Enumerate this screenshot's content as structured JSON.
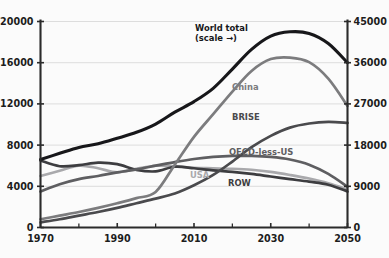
{
  "chart_data": {
    "type": "line",
    "title": "",
    "xlabel": "",
    "ylabel": "",
    "background": "#fbfbfb",
    "grid": true,
    "legend_position": "inline-annotations",
    "x": [
      1970,
      1975,
      1980,
      1985,
      1990,
      1995,
      2000,
      2005,
      2010,
      2015,
      2020,
      2025,
      2030,
      2035,
      2040,
      2045,
      2050
    ],
    "xlim": [
      1970,
      2050
    ],
    "x_ticks_major": [
      1970,
      1990,
      2010,
      2030,
      2050
    ],
    "x_ticks_minor": [
      1980,
      2000,
      2020,
      2040
    ],
    "axes": [
      {
        "id": "left",
        "ylim": [
          0,
          20000
        ],
        "ticks": [
          0,
          4000,
          8000,
          12000,
          16000,
          20000
        ],
        "tick_labels": [
          "0",
          "4000",
          "8000",
          "12000",
          "16000",
          "20000"
        ]
      },
      {
        "id": "right",
        "ylim": [
          0,
          45000
        ],
        "ticks": [
          0,
          9000,
          18000,
          27000,
          36000,
          45000
        ],
        "tick_labels": [
          "0",
          "9000",
          "18000",
          "27000",
          "36000",
          "45000"
        ]
      }
    ],
    "series": [
      {
        "name": "World total",
        "label": "World total",
        "sublabel": "(scale →)",
        "axis": "right",
        "color": "#17171a",
        "width": 3.1,
        "label_x": 195,
        "label_y": 31,
        "sublabel_x": 195,
        "sublabel_y": 41,
        "values": [
          14850,
          16200,
          17500,
          18300,
          19500,
          20800,
          22600,
          25200,
          27500,
          30400,
          34600,
          38900,
          41800,
          42750,
          42400,
          40200,
          36000
        ]
      },
      {
        "name": "China",
        "label": "China",
        "axis": "left",
        "color": "#7c7c7e",
        "width": 2.7,
        "label_x": 232,
        "label_y": 90,
        "values": [
          800,
          1150,
          1500,
          1900,
          2350,
          2850,
          3450,
          6100,
          8800,
          11000,
          13200,
          15200,
          16350,
          16500,
          16050,
          14450,
          11800
        ]
      },
      {
        "name": "BRISE",
        "label": "BRISE",
        "axis": "left",
        "color": "#4a4a4d",
        "width": 2.7,
        "label_x": 232,
        "label_y": 120,
        "values": [
          500,
          800,
          1150,
          1500,
          1900,
          2350,
          2800,
          3300,
          4100,
          5100,
          6400,
          7800,
          8900,
          9700,
          10100,
          10250,
          10150
        ]
      },
      {
        "name": "OECD-less-US",
        "label": "OECD-less-US",
        "axis": "left",
        "color": "#5e5e61",
        "width": 2.7,
        "label_x": 229,
        "label_y": 155,
        "values": [
          3500,
          4200,
          4700,
          5000,
          5350,
          5650,
          6000,
          6350,
          6650,
          6850,
          6950,
          6950,
          6850,
          6600,
          6100,
          5200,
          3950
        ]
      },
      {
        "name": "USA",
        "label": "USA",
        "axis": "left",
        "color": "#a9a9ac",
        "width": 2.6,
        "label_x": 190,
        "label_y": 178,
        "values": [
          5000,
          5500,
          6000,
          5750,
          5350,
          5700,
          6000,
          5950,
          5800,
          5750,
          5700,
          5600,
          5400,
          5100,
          4750,
          4300,
          3700
        ]
      },
      {
        "name": "ROW",
        "label": "ROW",
        "axis": "left",
        "color": "#3d3d40",
        "width": 2.7,
        "label_x": 228,
        "label_y": 186,
        "values": [
          6500,
          5950,
          6050,
          6300,
          6150,
          5600,
          5450,
          5900,
          5750,
          5550,
          5400,
          5200,
          4950,
          4700,
          4450,
          4150,
          3500
        ]
      }
    ]
  }
}
